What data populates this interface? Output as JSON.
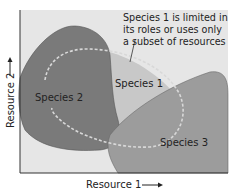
{
  "diagram": {
    "annotation": [
      "Species 1 is limited in",
      "its roles or uses only",
      "a subset of resources"
    ],
    "species": {
      "s1": "Species 1",
      "s2": "Species 2",
      "s3": "Species 3"
    },
    "axes": {
      "x_label": "Resource 1",
      "y_label": "Resource 2"
    },
    "colors": {
      "background": "#e4e4e4",
      "species1": "#c9c9c9",
      "species2": "#7b7b7b",
      "species3": "#9d9d9d",
      "dashed": "#d8d8d8"
    }
  }
}
